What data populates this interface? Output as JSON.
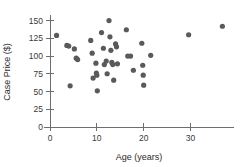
{
  "chart_data": {
    "type": "scatter",
    "title": "",
    "xlabel": "Age (years)",
    "ylabel": "Case Price ($)",
    "xlim": [
      0,
      38
    ],
    "ylim": [
      0,
      155
    ],
    "xticks": [
      0,
      10,
      20,
      30
    ],
    "yticks": [
      0,
      25,
      50,
      75,
      100,
      125,
      150
    ],
    "xtick_labels": [
      "0",
      "10",
      "20",
      "30"
    ],
    "ytick_labels": [
      "0",
      "25",
      "50",
      "75",
      "100",
      "125",
      "150"
    ],
    "grid": false,
    "legend": null,
    "marker_color": "#5a5a5a",
    "axis_color": "#6e6e6e",
    "points": [
      {
        "x": 1.4,
        "y": 129
      },
      {
        "x": 3.6,
        "y": 115
      },
      {
        "x": 4.0,
        "y": 114
      },
      {
        "x": 4.3,
        "y": 58
      },
      {
        "x": 5.2,
        "y": 110
      },
      {
        "x": 5.6,
        "y": 97
      },
      {
        "x": 5.9,
        "y": 95
      },
      {
        "x": 8.7,
        "y": 122
      },
      {
        "x": 9.0,
        "y": 104
      },
      {
        "x": 9.2,
        "y": 69
      },
      {
        "x": 9.8,
        "y": 90
      },
      {
        "x": 9.9,
        "y": 76
      },
      {
        "x": 10.0,
        "y": 73
      },
      {
        "x": 10.1,
        "y": 51
      },
      {
        "x": 11.0,
        "y": 133
      },
      {
        "x": 11.4,
        "y": 111
      },
      {
        "x": 11.6,
        "y": 88
      },
      {
        "x": 12.0,
        "y": 93
      },
      {
        "x": 12.2,
        "y": 75
      },
      {
        "x": 12.6,
        "y": 150
      },
      {
        "x": 12.8,
        "y": 127
      },
      {
        "x": 13.0,
        "y": 108
      },
      {
        "x": 13.2,
        "y": 91
      },
      {
        "x": 13.4,
        "y": 88
      },
      {
        "x": 13.6,
        "y": 66
      },
      {
        "x": 14.0,
        "y": 117
      },
      {
        "x": 14.2,
        "y": 113
      },
      {
        "x": 14.4,
        "y": 89
      },
      {
        "x": 16.3,
        "y": 137
      },
      {
        "x": 16.6,
        "y": 100
      },
      {
        "x": 17.2,
        "y": 100
      },
      {
        "x": 17.8,
        "y": 80
      },
      {
        "x": 19.6,
        "y": 118
      },
      {
        "x": 19.8,
        "y": 87
      },
      {
        "x": 19.9,
        "y": 73
      },
      {
        "x": 20.0,
        "y": 59
      },
      {
        "x": 21.5,
        "y": 101
      },
      {
        "x": 29.6,
        "y": 130
      },
      {
        "x": 36.8,
        "y": 142
      }
    ]
  },
  "layout": {
    "plot_left": 50,
    "plot_right": 228,
    "plot_top": 17,
    "plot_bottom": 127,
    "point_radius": 2.6
  }
}
